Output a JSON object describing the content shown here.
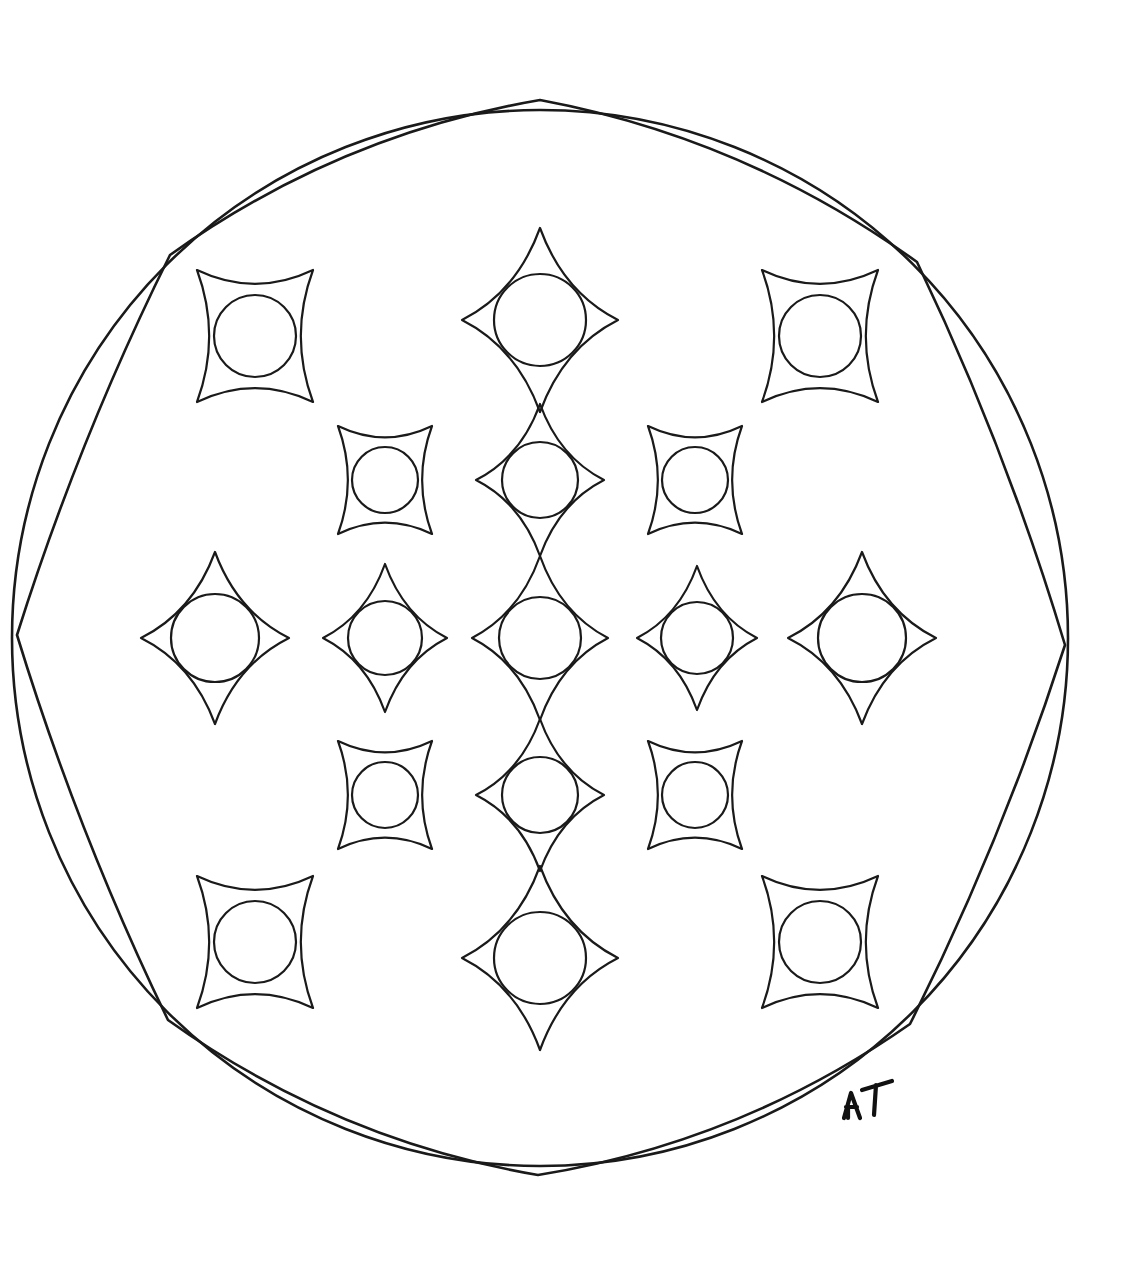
{
  "artwork": {
    "title": "Octagonal Mandala Coloring Page",
    "medium": "hand-drawn ink line art",
    "background_color": "#ffffff",
    "ink_color": "#1a1a1a",
    "canvas": {
      "width": 1144,
      "height": 1264
    },
    "signature": {
      "text": "AT",
      "x": 862,
      "y": 1104,
      "description": "artist initials lower right"
    },
    "outer_circle": {
      "name": "outer-circle",
      "cx": 540,
      "cy": 638,
      "r": 528
    },
    "frame": {
      "name": "inner-octagon-frame",
      "description": "eight-sided frame of outward-bulging arcs; four cusp vertices lie on the outer circle at N, E, S, W and four straight-ish corner vertices lie inside",
      "vertices": [
        {
          "name": "cusp-north",
          "x": 540,
          "y": 100,
          "type": "cusp"
        },
        {
          "name": "corner-north-east",
          "x": 917,
          "y": 262,
          "type": "corner"
        },
        {
          "name": "cusp-east",
          "x": 1065,
          "y": 645,
          "type": "cusp"
        },
        {
          "name": "corner-south-east",
          "x": 910,
          "y": 1024,
          "type": "corner"
        },
        {
          "name": "cusp-south",
          "x": 538,
          "y": 1175,
          "type": "cusp"
        },
        {
          "name": "corner-south-west",
          "x": 168,
          "y": 1020,
          "type": "corner"
        },
        {
          "name": "cusp-west",
          "x": 17,
          "y": 635,
          "type": "cusp"
        },
        {
          "name": "corner-north-west",
          "x": 170,
          "y": 255,
          "type": "corner"
        }
      ],
      "edges": [
        {
          "from": "cusp-north",
          "to": "corner-north-east",
          "bulge": 46
        },
        {
          "from": "corner-north-east",
          "to": "cusp-east",
          "bulge": 16
        },
        {
          "from": "cusp-east",
          "to": "corner-south-east",
          "bulge": 16
        },
        {
          "from": "corner-south-east",
          "to": "cusp-south",
          "bulge": 46
        },
        {
          "from": "cusp-south",
          "to": "corner-south-west",
          "bulge": 46
        },
        {
          "from": "corner-south-west",
          "to": "cusp-west",
          "bulge": 16
        },
        {
          "from": "cusp-west",
          "to": "corner-north-west",
          "bulge": 16
        },
        {
          "from": "corner-north-west",
          "to": "cusp-north",
          "bulge": 46
        }
      ]
    },
    "motif_legend": {
      "star": "four-pointed concave star (astroid) with long sharp cusps, circle inscribed",
      "square": "concave square with short corner points and concave arc sides, circle inscribed"
    },
    "rows": [
      {
        "name": "row-1",
        "cy": 336,
        "motifs": [
          {
            "name": "motif-r1-c1",
            "type": "square",
            "cx": 255,
            "cy": 336,
            "rx": 58,
            "ry": 66,
            "circle_r": 41
          },
          {
            "name": "motif-r1-c2",
            "type": "star",
            "cx": 540,
            "cy": 320,
            "rx": 78,
            "ry": 92,
            "circle_r": 46
          },
          {
            "name": "motif-r1-c3",
            "type": "square",
            "cx": 820,
            "cy": 336,
            "rx": 58,
            "ry": 66,
            "circle_r": 41
          }
        ]
      },
      {
        "name": "row-2",
        "cy": 480,
        "motifs": [
          {
            "name": "motif-r2-c1",
            "type": "square",
            "cx": 385,
            "cy": 480,
            "rx": 47,
            "ry": 54,
            "circle_r": 33
          },
          {
            "name": "motif-r2-c2",
            "type": "star",
            "cx": 540,
            "cy": 480,
            "rx": 64,
            "ry": 76,
            "circle_r": 38
          },
          {
            "name": "motif-r2-c3",
            "type": "square",
            "cx": 695,
            "cy": 480,
            "rx": 47,
            "ry": 54,
            "circle_r": 33
          }
        ]
      },
      {
        "name": "row-3",
        "cy": 638,
        "motifs": [
          {
            "name": "motif-r3-c1",
            "type": "star",
            "cx": 215,
            "cy": 638,
            "rx": 74,
            "ry": 86,
            "circle_r": 44
          },
          {
            "name": "motif-r3-c2",
            "type": "star",
            "cx": 385,
            "cy": 638,
            "rx": 62,
            "ry": 74,
            "circle_r": 37
          },
          {
            "name": "motif-r3-c3",
            "type": "star",
            "cx": 540,
            "cy": 638,
            "rx": 68,
            "ry": 82,
            "circle_r": 41
          },
          {
            "name": "motif-r3-c4",
            "type": "star",
            "cx": 697,
            "cy": 638,
            "rx": 60,
            "ry": 72,
            "circle_r": 36
          },
          {
            "name": "motif-r3-c5",
            "type": "star",
            "cx": 862,
            "cy": 638,
            "rx": 74,
            "ry": 86,
            "circle_r": 44
          }
        ]
      },
      {
        "name": "row-4",
        "cy": 795,
        "motifs": [
          {
            "name": "motif-r4-c1",
            "type": "square",
            "cx": 385,
            "cy": 795,
            "rx": 47,
            "ry": 54,
            "circle_r": 33
          },
          {
            "name": "motif-r4-c2",
            "type": "star",
            "cx": 540,
            "cy": 795,
            "rx": 64,
            "ry": 76,
            "circle_r": 38
          },
          {
            "name": "motif-r4-c3",
            "type": "square",
            "cx": 695,
            "cy": 795,
            "rx": 47,
            "ry": 54,
            "circle_r": 33
          }
        ]
      },
      {
        "name": "row-5",
        "cy": 942,
        "motifs": [
          {
            "name": "motif-r5-c1",
            "type": "square",
            "cx": 255,
            "cy": 942,
            "rx": 58,
            "ry": 66,
            "circle_r": 41
          },
          {
            "name": "motif-r5-c2",
            "type": "star",
            "cx": 540,
            "cy": 958,
            "rx": 78,
            "ry": 92,
            "circle_r": 46
          },
          {
            "name": "motif-r5-c3",
            "type": "square",
            "cx": 820,
            "cy": 942,
            "rx": 58,
            "ry": 66,
            "circle_r": 41
          }
        ]
      }
    ],
    "counts": {
      "total_motifs": 17,
      "stars": 9,
      "squares": 8,
      "inscribed_circles": 17
    }
  }
}
